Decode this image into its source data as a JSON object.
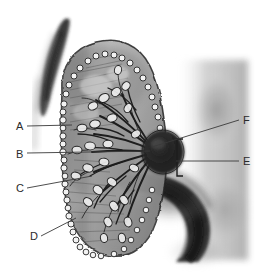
{
  "figure": {
    "medium": "pencil / charcoal grayscale drawing",
    "background_color": "#ffffff",
    "ink_color": "#2b2b2b",
    "width": 264,
    "height": 276
  },
  "labels": [
    {
      "id": "A",
      "text": "A",
      "side": "left",
      "text_x": 16,
      "text_y": 130,
      "leader": {
        "x1": 27,
        "y1": 126,
        "x2": 72,
        "y2": 125
      }
    },
    {
      "id": "B",
      "text": "B",
      "side": "left",
      "text_x": 16,
      "text_y": 158,
      "leader": {
        "x1": 27,
        "y1": 153,
        "x2": 150,
        "y2": 151
      }
    },
    {
      "id": "C",
      "text": "C",
      "side": "left",
      "text_x": 16,
      "text_y": 192,
      "leader": {
        "x1": 27,
        "y1": 188,
        "x2": 92,
        "y2": 176
      }
    },
    {
      "id": "D",
      "text": "D",
      "side": "left",
      "text_x": 30,
      "text_y": 240,
      "leader": {
        "x1": 41,
        "y1": 236,
        "x2": 76,
        "y2": 218
      }
    },
    {
      "id": "E",
      "text": "E",
      "side": "right",
      "text_x": 243,
      "text_y": 165,
      "leader": {
        "x1": 176,
        "y1": 161,
        "x2": 239,
        "y2": 161
      }
    },
    {
      "id": "F",
      "text": "F",
      "side": "right",
      "text_x": 243,
      "text_y": 124,
      "leader": {
        "x1": 152,
        "y1": 147,
        "x2": 239,
        "y2": 120
      }
    }
  ],
  "bracket": {
    "name": "span-bracket-E",
    "x": 177,
    "y_top": 139,
    "y_bottom": 176,
    "tick_length": 6
  },
  "structures": [
    {
      "name": "upper-left-dark-wedge",
      "description": "dark tapering charcoal stroke at upper left"
    },
    {
      "name": "organ-body-outline",
      "description": "large rounded sectioned body with beaded rim"
    },
    {
      "name": "beaded-rim",
      "description": "chain of light nodules along the left and lower margin"
    },
    {
      "name": "villous-fan",
      "description": "fan of branching vessels converging to a central hilum"
    },
    {
      "name": "central-hilum-mass",
      "description": "dark round mass at the convergence point"
    },
    {
      "name": "lower-right-dark-arc",
      "description": "broad dark curved band sweeping to the lower right"
    },
    {
      "name": "right-background-shading",
      "description": "soft dark pencil shading on right margin"
    }
  ]
}
